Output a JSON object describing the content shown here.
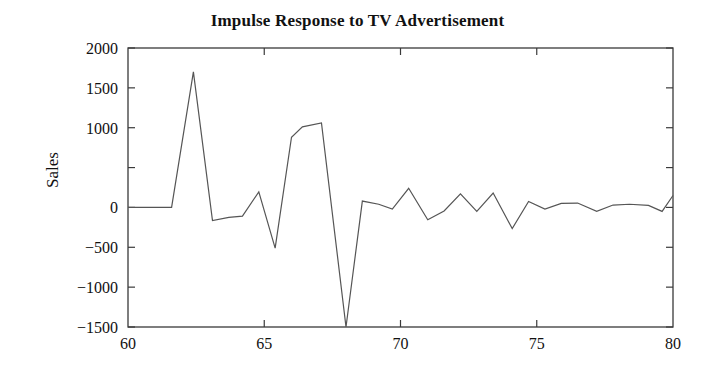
{
  "chart_data": {
    "type": "line",
    "title": "Impulse Response to TV Advertisement",
    "xlabel": "",
    "ylabel": "Sales",
    "xlim": [
      60,
      80
    ],
    "ylim": [
      -1500,
      2000
    ],
    "grid": false,
    "legend": null,
    "xticks": [
      60,
      65,
      70,
      75,
      80
    ],
    "xtick_labels": [
      "60",
      "65",
      "70",
      "75",
      "80"
    ],
    "yticks": [
      -1500,
      -1000,
      -500,
      0,
      500,
      1000,
      1500,
      2000
    ],
    "ytick_labels": [
      "-1500",
      "-1000",
      "-500",
      "0",
      "",
      "1000",
      "1500",
      "2000"
    ],
    "line_color": "#555555",
    "line_width": 1.2,
    "series": [
      {
        "name": "Impulse Response",
        "x": [
          60.0,
          60.6,
          61.2,
          61.6,
          62.4,
          63.1,
          63.7,
          64.2,
          64.8,
          65.4,
          66.0,
          66.4,
          67.1,
          68.0,
          68.6,
          69.2,
          69.7,
          70.3,
          71.0,
          71.6,
          72.2,
          72.8,
          73.4,
          74.1,
          74.7,
          75.3,
          75.9,
          76.5,
          77.2,
          77.8,
          78.4,
          79.1,
          79.6,
          80.0
        ],
        "y": [
          0,
          0,
          0,
          0,
          1700,
          -165,
          -125,
          -110,
          195,
          -510,
          880,
          1010,
          1060,
          -1500,
          80,
          40,
          -20,
          240,
          -155,
          -45,
          170,
          -50,
          180,
          -265,
          75,
          -20,
          50,
          55,
          -50,
          30,
          40,
          25,
          -50,
          150
        ]
      }
    ]
  }
}
